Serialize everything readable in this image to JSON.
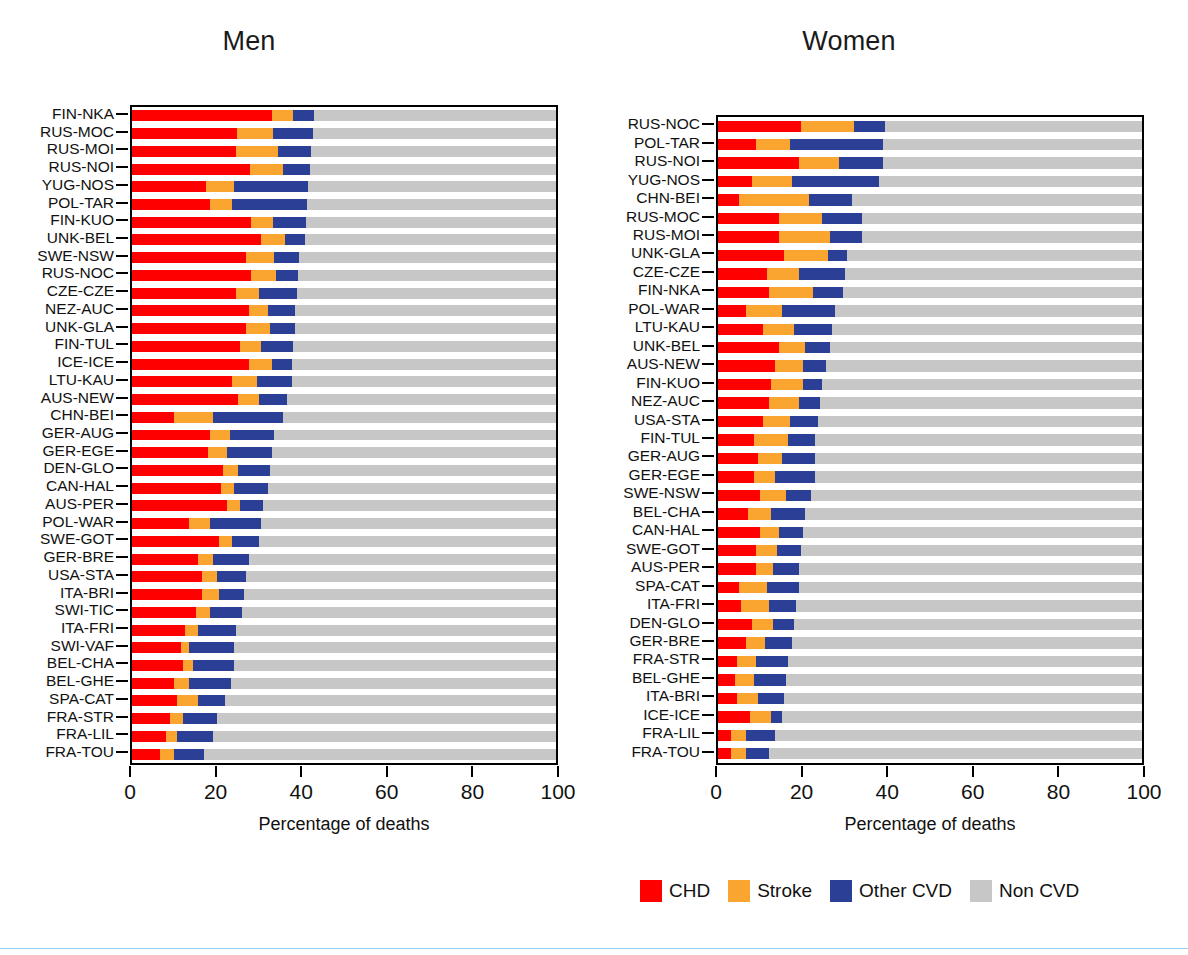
{
  "figure": {
    "background": "#ffffff",
    "bottom_rule_color": "#8fd2f0"
  },
  "legend": {
    "items": [
      {
        "label": "CHD",
        "color": "#ff0000",
        "key": "chd"
      },
      {
        "label": "Stroke",
        "color": "#f9a530",
        "key": "stroke"
      },
      {
        "label": "Other CVD",
        "color": "#2b3f96",
        "key": "other_cvd"
      },
      {
        "label": "Non CVD",
        "color": "#c7c7c7",
        "key": "non_cvd"
      }
    ]
  },
  "panels": {
    "men": {
      "title": "Men",
      "xlabel": "Percentage of deaths"
    },
    "women": {
      "title": "Women",
      "xlabel": "Percentage of deaths"
    }
  },
  "axis": {
    "ticks": [
      0,
      20,
      40,
      60,
      80,
      100
    ],
    "tick_labels": [
      "0",
      "20",
      "40",
      "60",
      "80",
      "100"
    ],
    "min": 0,
    "max": 100
  },
  "chart_data": [
    {
      "type": "bar",
      "orientation": "horizontal",
      "stacked": true,
      "title": "Men",
      "xlabel": "Percentage of deaths",
      "ylabel": "",
      "xlim": [
        0,
        100
      ],
      "grid": false,
      "legend_position": "bottom",
      "series": [
        {
          "name": "CHD",
          "color": "#ff0000"
        },
        {
          "name": "Stroke",
          "color": "#f9a530"
        },
        {
          "name": "Other CVD",
          "color": "#2b3f96"
        },
        {
          "name": "Non CVD",
          "color": "#c7c7c7"
        }
      ],
      "categories": [
        "FIN-NKA",
        "RUS-MOC",
        "RUS-MOI",
        "RUS-NOI",
        "YUG-NOS",
        "POL-TAR",
        "FIN-KUO",
        "UNK-BEL",
        "SWE-NSW",
        "RUS-NOC",
        "CZE-CZE",
        "NEZ-AUC",
        "UNK-GLA",
        "FIN-TUL",
        "ICE-ICE",
        "LTU-KAU",
        "AUS-NEW",
        "CHN-BEI",
        "GER-AUG",
        "GER-EGE",
        "DEN-GLO",
        "CAN-HAL",
        "AUS-PER",
        "POL-WAR",
        "SWE-GOT",
        "GER-BRE",
        "USA-STA",
        "ITA-BRI",
        "SWI-TIC",
        "ITA-FRI",
        "SWI-VAF",
        "BEL-CHA",
        "BEL-GHE",
        "SPA-CAT",
        "FRA-STR",
        "FRA-LIL",
        "FRA-TOU"
      ],
      "rows": [
        {
          "category": "FIN-NKA",
          "chd": 33.0,
          "stroke": 5.0,
          "other_cvd": 5.0,
          "non_cvd": 57.0,
          "total_cvd": 43.0
        },
        {
          "category": "RUS-MOC",
          "chd": 24.8,
          "stroke": 8.5,
          "other_cvd": 9.5,
          "non_cvd": 57.2,
          "total_cvd": 42.8
        },
        {
          "category": "RUS-MOI",
          "chd": 24.5,
          "stroke": 10.0,
          "other_cvd": 7.8,
          "non_cvd": 57.7,
          "total_cvd": 42.3
        },
        {
          "category": "RUS-NOI",
          "chd": 27.8,
          "stroke": 7.8,
          "other_cvd": 6.5,
          "non_cvd": 57.9,
          "total_cvd": 42.1
        },
        {
          "category": "YUG-NOS",
          "chd": 17.5,
          "stroke": 6.5,
          "other_cvd": 17.5,
          "non_cvd": 58.5,
          "total_cvd": 41.5
        },
        {
          "category": "POL-TAR",
          "chd": 18.5,
          "stroke": 5.2,
          "other_cvd": 17.5,
          "non_cvd": 58.8,
          "total_cvd": 41.2
        },
        {
          "category": "FIN-KUO",
          "chd": 28.0,
          "stroke": 5.2,
          "other_cvd": 7.8,
          "non_cvd": 59.0,
          "total_cvd": 41.0
        },
        {
          "category": "UNK-BEL",
          "chd": 30.5,
          "stroke": 5.5,
          "other_cvd": 4.8,
          "non_cvd": 59.2,
          "total_cvd": 40.8
        },
        {
          "category": "SWE-NSW",
          "chd": 27.0,
          "stroke": 6.5,
          "other_cvd": 6.0,
          "non_cvd": 60.5,
          "total_cvd": 39.5
        },
        {
          "category": "RUS-NOC",
          "chd": 28.0,
          "stroke": 6.0,
          "other_cvd": 5.2,
          "non_cvd": 60.8,
          "total_cvd": 39.2
        },
        {
          "category": "CZE-CZE",
          "chd": 24.5,
          "stroke": 5.5,
          "other_cvd": 9.0,
          "non_cvd": 61.0,
          "total_cvd": 39.0
        },
        {
          "category": "NEZ-AUC",
          "chd": 27.5,
          "stroke": 4.5,
          "other_cvd": 6.5,
          "non_cvd": 61.5,
          "total_cvd": 38.5
        },
        {
          "category": "UNK-GLA",
          "chd": 27.0,
          "stroke": 5.5,
          "other_cvd": 6.0,
          "non_cvd": 61.5,
          "total_cvd": 38.5
        },
        {
          "category": "FIN-TUL",
          "chd": 25.5,
          "stroke": 5.0,
          "other_cvd": 7.5,
          "non_cvd": 62.0,
          "total_cvd": 38.0
        },
        {
          "category": "ICE-ICE",
          "chd": 27.5,
          "stroke": 5.5,
          "other_cvd": 4.8,
          "non_cvd": 62.2,
          "total_cvd": 37.8
        },
        {
          "category": "LTU-KAU",
          "chd": 23.5,
          "stroke": 6.0,
          "other_cvd": 8.2,
          "non_cvd": 62.3,
          "total_cvd": 37.7
        },
        {
          "category": "AUS-NEW",
          "chd": 25.0,
          "stroke": 5.0,
          "other_cvd": 6.5,
          "non_cvd": 63.5,
          "total_cvd": 36.5
        },
        {
          "category": "CHN-BEI",
          "chd": 10.0,
          "stroke": 9.0,
          "other_cvd": 16.5,
          "non_cvd": 64.5,
          "total_cvd": 35.5
        },
        {
          "category": "GER-AUG",
          "chd": 18.5,
          "stroke": 4.5,
          "other_cvd": 10.5,
          "non_cvd": 66.5,
          "total_cvd": 33.5
        },
        {
          "category": "GER-EGE",
          "chd": 18.0,
          "stroke": 4.5,
          "other_cvd": 10.5,
          "non_cvd": 67.0,
          "total_cvd": 33.0
        },
        {
          "category": "DEN-GLO",
          "chd": 21.5,
          "stroke": 3.5,
          "other_cvd": 7.5,
          "non_cvd": 67.5,
          "total_cvd": 32.5
        },
        {
          "category": "CAN-HAL",
          "chd": 21.0,
          "stroke": 3.0,
          "other_cvd": 8.0,
          "non_cvd": 68.0,
          "total_cvd": 32.0
        },
        {
          "category": "AUS-PER",
          "chd": 22.5,
          "stroke": 3.0,
          "other_cvd": 5.5,
          "non_cvd": 69.0,
          "total_cvd": 31.0
        },
        {
          "category": "POL-WAR",
          "chd": 13.5,
          "stroke": 5.0,
          "other_cvd": 12.0,
          "non_cvd": 69.5,
          "total_cvd": 30.5
        },
        {
          "category": "SWE-GOT",
          "chd": 20.5,
          "stroke": 3.0,
          "other_cvd": 6.5,
          "non_cvd": 70.0,
          "total_cvd": 30.0
        },
        {
          "category": "GER-BRE",
          "chd": 15.5,
          "stroke": 3.5,
          "other_cvd": 8.5,
          "non_cvd": 72.5,
          "total_cvd": 27.5
        },
        {
          "category": "USA-STA",
          "chd": 16.5,
          "stroke": 3.5,
          "other_cvd": 7.0,
          "non_cvd": 73.0,
          "total_cvd": 27.0
        },
        {
          "category": "ITA-BRI",
          "chd": 16.5,
          "stroke": 4.0,
          "other_cvd": 6.0,
          "non_cvd": 73.5,
          "total_cvd": 26.5
        },
        {
          "category": "SWI-TIC",
          "chd": 15.0,
          "stroke": 3.5,
          "other_cvd": 7.5,
          "non_cvd": 74.0,
          "total_cvd": 26.0
        },
        {
          "category": "ITA-FRI",
          "chd": 12.5,
          "stroke": 3.0,
          "other_cvd": 9.0,
          "non_cvd": 75.5,
          "total_cvd": 24.5
        },
        {
          "category": "SWI-VAF",
          "chd": 11.5,
          "stroke": 2.0,
          "other_cvd": 10.5,
          "non_cvd": 76.0,
          "total_cvd": 24.0
        },
        {
          "category": "BEL-CHA",
          "chd": 12.0,
          "stroke": 2.5,
          "other_cvd": 9.5,
          "non_cvd": 76.0,
          "total_cvd": 24.0
        },
        {
          "category": "BEL-GHE",
          "chd": 10.0,
          "stroke": 3.5,
          "other_cvd": 9.8,
          "non_cvd": 76.7,
          "total_cvd": 23.3
        },
        {
          "category": "SPA-CAT",
          "chd": 10.5,
          "stroke": 5.0,
          "other_cvd": 6.5,
          "non_cvd": 78.0,
          "total_cvd": 22.0
        },
        {
          "category": "FRA-STR",
          "chd": 9.0,
          "stroke": 3.0,
          "other_cvd": 8.0,
          "non_cvd": 80.0,
          "total_cvd": 20.0
        },
        {
          "category": "FRA-LIL",
          "chd": 8.0,
          "stroke": 2.5,
          "other_cvd": 8.5,
          "non_cvd": 81.0,
          "total_cvd": 19.0
        },
        {
          "category": "FRA-TOU",
          "chd": 6.5,
          "stroke": 3.5,
          "other_cvd": 7.0,
          "non_cvd": 83.0,
          "total_cvd": 17.0
        }
      ]
    },
    {
      "type": "bar",
      "orientation": "horizontal",
      "stacked": true,
      "title": "Women",
      "xlabel": "Percentage of deaths",
      "ylabel": "",
      "xlim": [
        0,
        100
      ],
      "grid": false,
      "legend_position": "bottom",
      "series": [
        {
          "name": "CHD",
          "color": "#ff0000"
        },
        {
          "name": "Stroke",
          "color": "#f9a530"
        },
        {
          "name": "Other CVD",
          "color": "#2b3f96"
        },
        {
          "name": "Non CVD",
          "color": "#c7c7c7"
        }
      ],
      "categories": [
        "RUS-NOC",
        "POL-TAR",
        "RUS-NOI",
        "YUG-NOS",
        "CHN-BEI",
        "RUS-MOC",
        "RUS-MOI",
        "UNK-GLA",
        "CZE-CZE",
        "FIN-NKA",
        "POL-WAR",
        "LTU-KAU",
        "UNK-BEL",
        "AUS-NEW",
        "FIN-KUO",
        "NEZ-AUC",
        "USA-STA",
        "FIN-TUL",
        "GER-AUG",
        "GER-EGE",
        "SWE-NSW",
        "BEL-CHA",
        "CAN-HAL",
        "SWE-GOT",
        "AUS-PER",
        "SPA-CAT",
        "ITA-FRI",
        "DEN-GLO",
        "GER-BRE",
        "FRA-STR",
        "BEL-GHE",
        "ITA-BRI",
        "ICE-ICE",
        "FRA-LIL",
        "FRA-TOU"
      ],
      "rows": [
        {
          "category": "RUS-NOC",
          "chd": 19.5,
          "stroke": 12.5,
          "other_cvd": 7.5,
          "non_cvd": 60.5,
          "total_cvd": 39.5
        },
        {
          "category": "POL-TAR",
          "chd": 9.0,
          "stroke": 8.0,
          "other_cvd": 22.0,
          "non_cvd": 61.0,
          "total_cvd": 39.0
        },
        {
          "category": "RUS-NOI",
          "chd": 19.0,
          "stroke": 9.5,
          "other_cvd": 10.5,
          "non_cvd": 61.0,
          "total_cvd": 39.0
        },
        {
          "category": "YUG-NOS",
          "chd": 8.0,
          "stroke": 9.5,
          "other_cvd": 20.5,
          "non_cvd": 62.0,
          "total_cvd": 38.0
        },
        {
          "category": "CHN-BEI",
          "chd": 5.0,
          "stroke": 16.5,
          "other_cvd": 10.0,
          "non_cvd": 68.5,
          "total_cvd": 31.5
        },
        {
          "category": "RUS-MOC",
          "chd": 14.5,
          "stroke": 10.0,
          "other_cvd": 9.5,
          "non_cvd": 66.0,
          "total_cvd": 34.0
        },
        {
          "category": "RUS-MOI",
          "chd": 14.5,
          "stroke": 12.0,
          "other_cvd": 7.5,
          "non_cvd": 66.0,
          "total_cvd": 34.0
        },
        {
          "category": "UNK-GLA",
          "chd": 15.5,
          "stroke": 10.5,
          "other_cvd": 4.5,
          "non_cvd": 69.5,
          "total_cvd": 30.5
        },
        {
          "category": "CZE-CZE",
          "chd": 11.5,
          "stroke": 7.5,
          "other_cvd": 11.0,
          "non_cvd": 70.0,
          "total_cvd": 30.0
        },
        {
          "category": "FIN-NKA",
          "chd": 12.0,
          "stroke": 10.5,
          "other_cvd": 7.0,
          "non_cvd": 70.5,
          "total_cvd": 29.5
        },
        {
          "category": "POL-WAR",
          "chd": 6.5,
          "stroke": 8.5,
          "other_cvd": 12.5,
          "non_cvd": 72.5,
          "total_cvd": 27.5
        },
        {
          "category": "LTU-KAU",
          "chd": 10.5,
          "stroke": 7.5,
          "other_cvd": 9.0,
          "non_cvd": 73.0,
          "total_cvd": 27.0
        },
        {
          "category": "UNK-BEL",
          "chd": 14.5,
          "stroke": 6.0,
          "other_cvd": 6.0,
          "non_cvd": 73.5,
          "total_cvd": 26.5
        },
        {
          "category": "AUS-NEW",
          "chd": 13.5,
          "stroke": 6.5,
          "other_cvd": 5.5,
          "non_cvd": 74.5,
          "total_cvd": 25.5
        },
        {
          "category": "FIN-KUO",
          "chd": 12.5,
          "stroke": 7.5,
          "other_cvd": 4.5,
          "non_cvd": 75.5,
          "total_cvd": 24.5
        },
        {
          "category": "NEZ-AUC",
          "chd": 12.0,
          "stroke": 7.0,
          "other_cvd": 5.0,
          "non_cvd": 76.0,
          "total_cvd": 24.0
        },
        {
          "category": "USA-STA",
          "chd": 10.5,
          "stroke": 6.5,
          "other_cvd": 6.5,
          "non_cvd": 76.5,
          "total_cvd": 23.5
        },
        {
          "category": "FIN-TUL",
          "chd": 8.5,
          "stroke": 8.0,
          "other_cvd": 6.5,
          "non_cvd": 77.0,
          "total_cvd": 23.0
        },
        {
          "category": "GER-AUG",
          "chd": 9.5,
          "stroke": 5.5,
          "other_cvd": 8.0,
          "non_cvd": 77.0,
          "total_cvd": 23.0
        },
        {
          "category": "GER-EGE",
          "chd": 8.5,
          "stroke": 5.0,
          "other_cvd": 9.5,
          "non_cvd": 77.0,
          "total_cvd": 23.0
        },
        {
          "category": "SWE-NSW",
          "chd": 10.0,
          "stroke": 6.0,
          "other_cvd": 6.0,
          "non_cvd": 78.0,
          "total_cvd": 22.0
        },
        {
          "category": "BEL-CHA",
          "chd": 7.0,
          "stroke": 5.5,
          "other_cvd": 8.0,
          "non_cvd": 79.5,
          "total_cvd": 20.5
        },
        {
          "category": "CAN-HAL",
          "chd": 10.0,
          "stroke": 4.5,
          "other_cvd": 5.5,
          "non_cvd": 80.0,
          "total_cvd": 20.0
        },
        {
          "category": "SWE-GOT",
          "chd": 9.0,
          "stroke": 5.0,
          "other_cvd": 5.5,
          "non_cvd": 80.5,
          "total_cvd": 19.5
        },
        {
          "category": "AUS-PER",
          "chd": 9.0,
          "stroke": 4.0,
          "other_cvd": 6.0,
          "non_cvd": 81.0,
          "total_cvd": 19.0
        },
        {
          "category": "SPA-CAT",
          "chd": 5.0,
          "stroke": 6.5,
          "other_cvd": 7.5,
          "non_cvd": 81.0,
          "total_cvd": 19.0
        },
        {
          "category": "ITA-FRI",
          "chd": 5.5,
          "stroke": 6.5,
          "other_cvd": 6.5,
          "non_cvd": 81.5,
          "total_cvd": 18.5
        },
        {
          "category": "DEN-GLO",
          "chd": 8.0,
          "stroke": 5.0,
          "other_cvd": 5.0,
          "non_cvd": 82.0,
          "total_cvd": 18.0
        },
        {
          "category": "GER-BRE",
          "chd": 6.5,
          "stroke": 4.5,
          "other_cvd": 6.5,
          "non_cvd": 82.5,
          "total_cvd": 17.5
        },
        {
          "category": "FRA-STR",
          "chd": 4.5,
          "stroke": 4.5,
          "other_cvd": 7.5,
          "non_cvd": 83.5,
          "total_cvd": 16.5
        },
        {
          "category": "BEL-GHE",
          "chd": 4.0,
          "stroke": 4.5,
          "other_cvd": 7.5,
          "non_cvd": 84.0,
          "total_cvd": 16.0
        },
        {
          "category": "ITA-BRI",
          "chd": 4.5,
          "stroke": 5.0,
          "other_cvd": 6.0,
          "non_cvd": 84.5,
          "total_cvd": 15.5
        },
        {
          "category": "ICE-ICE",
          "chd": 7.5,
          "stroke": 5.0,
          "other_cvd": 2.5,
          "non_cvd": 85.0,
          "total_cvd": 15.0
        },
        {
          "category": "FRA-LIL",
          "chd": 3.0,
          "stroke": 3.5,
          "other_cvd": 7.0,
          "non_cvd": 86.5,
          "total_cvd": 13.5
        },
        {
          "category": "FRA-TOU",
          "chd": 3.0,
          "stroke": 3.5,
          "other_cvd": 5.5,
          "non_cvd": 88.0,
          "total_cvd": 12.0
        }
      ]
    }
  ]
}
